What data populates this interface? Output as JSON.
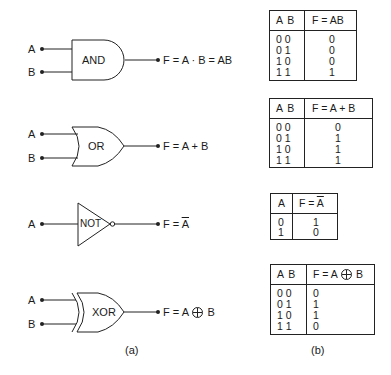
{
  "figure": {
    "panel_a_label": "(a)",
    "panel_b_label": "(b)"
  },
  "gates": [
    {
      "name": "AND",
      "inputs": [
        "A",
        "B"
      ],
      "output_expr": "F = A · B = AB"
    },
    {
      "name": "OR",
      "inputs": [
        "A",
        "B"
      ],
      "output_expr": "F = A + B"
    },
    {
      "name": "NOT",
      "inputs": [
        "A"
      ],
      "output_prefix": "F = ",
      "output_var": "A",
      "output_negated": true
    },
    {
      "name": "XOR",
      "inputs": [
        "A",
        "B"
      ],
      "output_prefix": "F = A ",
      "output_operator": "xor-circle-plus",
      "output_suffix": " B"
    }
  ],
  "truth_tables": [
    {
      "gate": "AND",
      "header_inputs": "A  B",
      "header_output": "F = AB",
      "rows": [
        [
          "0 0",
          "0"
        ],
        [
          "0 1",
          "0"
        ],
        [
          "1 0",
          "0"
        ],
        [
          "1 1",
          "1"
        ]
      ]
    },
    {
      "gate": "OR",
      "header_inputs": "A  B",
      "header_output": "F = A + B",
      "rows": [
        [
          "0 0",
          "0"
        ],
        [
          "0 1",
          "1"
        ],
        [
          "1 0",
          "1"
        ],
        [
          "1 1",
          "1"
        ]
      ]
    },
    {
      "gate": "NOT",
      "header_inputs": "A",
      "header_output_prefix": "F = ",
      "header_output_var": "A",
      "rows": [
        [
          "0",
          "1"
        ],
        [
          "1",
          "0"
        ]
      ]
    },
    {
      "gate": "XOR",
      "header_inputs": "A  B",
      "header_output_prefix": "F = A",
      "header_output_suffix": "B",
      "rows": [
        [
          "0 0",
          "0"
        ],
        [
          "0 1",
          "1"
        ],
        [
          "1 0",
          "1"
        ],
        [
          "1 1",
          "0"
        ]
      ]
    }
  ]
}
